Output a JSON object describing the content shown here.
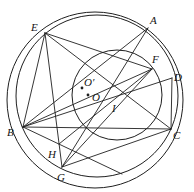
{
  "figure": {
    "background": "#ffffff",
    "stroke_color": "#1f1f1f",
    "label_color": "#141414",
    "label_font_size": 11,
    "circle_stroke_width": 1,
    "line_stroke_width": 0.9,
    "dot_radius": 1.4,
    "points": [
      {
        "name": "E",
        "x": 45,
        "y": 33,
        "label": "E",
        "label_x": 31,
        "label_y": 31,
        "dot": false,
        "hidden": false
      },
      {
        "name": "A",
        "x": 148,
        "y": 28,
        "label": "A",
        "label_x": 150,
        "label_y": 24,
        "dot": false,
        "hidden": false
      },
      {
        "name": "F",
        "x": 152,
        "y": 69,
        "label": "F",
        "label_x": 152,
        "label_y": 63,
        "dot": false,
        "hidden": false
      },
      {
        "name": "D",
        "x": 172,
        "y": 78,
        "label": "D",
        "label_x": 174,
        "label_y": 81,
        "dot": false,
        "hidden": false
      },
      {
        "name": "O1",
        "x": 82,
        "y": 88,
        "label": "O′",
        "label_x": 84,
        "label_y": 86,
        "dot": true,
        "hidden": false
      },
      {
        "name": "O",
        "x": 88,
        "y": 95,
        "label": "O",
        "label_x": 92,
        "label_y": 101,
        "dot": true,
        "hidden": false
      },
      {
        "name": "I",
        "x": 117,
        "y": 99,
        "label": "I",
        "label_x": 112,
        "label_y": 112,
        "dot": false,
        "hidden": false
      },
      {
        "name": "B",
        "x": 23,
        "y": 127,
        "label": "B",
        "label_x": 7,
        "label_y": 136,
        "dot": false,
        "hidden": false
      },
      {
        "name": "C",
        "x": 171,
        "y": 129,
        "label": "C",
        "label_x": 173,
        "label_y": 139,
        "dot": false,
        "hidden": false
      },
      {
        "name": "H",
        "x": 59,
        "y": 144,
        "label": "H",
        "label_x": 48,
        "label_y": 158,
        "dot": false,
        "hidden": false
      },
      {
        "name": "G",
        "x": 62,
        "y": 167,
        "label": "G",
        "label_x": 57,
        "label_y": 181,
        "dot": false,
        "hidden": false
      },
      {
        "name": "P",
        "x": 122,
        "y": 174,
        "label": "",
        "label_x": 0,
        "label_y": 0,
        "dot": false,
        "hidden": true
      }
    ],
    "circles": [
      {
        "name": "outer-circle",
        "cx": 95,
        "cy": 100,
        "r": 88
      },
      {
        "name": "big-inner-circle",
        "cx": 97,
        "cy": 96,
        "r": 81
      },
      {
        "name": "middle-circle",
        "cx": 117,
        "cy": 95,
        "r": 45
      }
    ],
    "segments": [
      {
        "from": "B",
        "to": "C"
      },
      {
        "from": "B",
        "to": "E"
      },
      {
        "from": "B",
        "to": "A"
      },
      {
        "from": "B",
        "to": "F"
      },
      {
        "from": "B",
        "to": "D"
      },
      {
        "from": "B",
        "to": "P"
      },
      {
        "from": "E",
        "to": "G"
      },
      {
        "from": "E",
        "to": "C"
      },
      {
        "from": "E",
        "to": "F"
      },
      {
        "from": "A",
        "to": "G"
      },
      {
        "from": "F",
        "to": "G"
      },
      {
        "from": "F",
        "to": "H"
      },
      {
        "from": "G",
        "to": "C"
      },
      {
        "from": "D",
        "to": "C"
      }
    ]
  }
}
